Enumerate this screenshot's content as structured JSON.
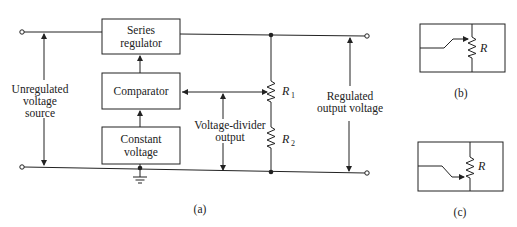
{
  "figure_a": {
    "caption": "(a)",
    "blocks": {
      "series_regulator": [
        "Series",
        "regulator"
      ],
      "comparator": [
        "Comparator"
      ],
      "constant_voltage": [
        "Constant",
        "voltage"
      ]
    },
    "labels": {
      "unregulated": [
        "Unregulated",
        "voltage",
        "source"
      ],
      "divider": [
        "Voltage-divider",
        "output"
      ],
      "regulated": [
        "Regulated",
        "output voltage"
      ]
    },
    "resistors": [
      {
        "name": "R",
        "subscript": "1"
      },
      {
        "name": "R",
        "subscript": "2"
      }
    ]
  },
  "figure_b": {
    "caption": "(b)",
    "resistor": "R",
    "wiper": "up"
  },
  "figure_c": {
    "caption": "(c)",
    "resistor": "R",
    "wiper": "down"
  }
}
